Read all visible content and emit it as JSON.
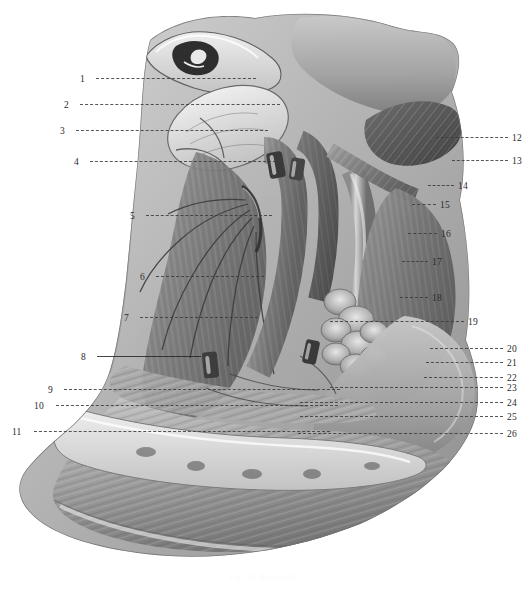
{
  "plate": {
    "kind": "anatomical-illustration",
    "subject": "grayscale neck dissection plate",
    "background_color": "#ffffff",
    "ink_color": "#2b2b2b",
    "leader_color": "#3a3a3a",
    "caption": "Fig. 72. Regio colli"
  },
  "labels_left": [
    {
      "n": "1",
      "x": 80,
      "y": 74,
      "lead_x": 96,
      "lead_w": 160,
      "style": "dashed"
    },
    {
      "n": "2",
      "x": 64,
      "y": 100,
      "lead_x": 80,
      "lead_w": 200,
      "style": "dashed"
    },
    {
      "n": "3",
      "x": 60,
      "y": 126,
      "lead_x": 76,
      "lead_w": 192,
      "style": "dashed"
    },
    {
      "n": "4",
      "x": 74,
      "y": 157,
      "lead_x": 90,
      "lead_w": 186,
      "style": "dashed"
    },
    {
      "n": "5",
      "x": 130,
      "y": 211,
      "lead_x": 146,
      "lead_w": 126,
      "style": "dashed"
    },
    {
      "n": "6",
      "x": 140,
      "y": 272,
      "lead_x": 156,
      "lead_w": 108,
      "style": "dashed"
    },
    {
      "n": "7",
      "x": 124,
      "y": 313,
      "lead_x": 140,
      "lead_w": 118,
      "style": "dashed"
    },
    {
      "n": "8",
      "x": 81,
      "y": 352,
      "lead_x": 97,
      "lead_w": 104,
      "style": "solid"
    },
    {
      "n": "9",
      "x": 48,
      "y": 385,
      "lead_x": 64,
      "lead_w": 276,
      "style": "dashed"
    },
    {
      "n": "10",
      "x": 34,
      "y": 401,
      "lead_x": 56,
      "lead_w": 282,
      "style": "dashed"
    },
    {
      "n": "11",
      "x": 12,
      "y": 427,
      "lead_x": 34,
      "lead_w": 296,
      "style": "dashed"
    }
  ],
  "labels_right": [
    {
      "n": "12",
      "x": 512,
      "y": 133,
      "lead_x": 436,
      "lead_w": 72,
      "style": "dashed"
    },
    {
      "n": "13",
      "x": 512,
      "y": 156,
      "lead_x": 452,
      "lead_w": 56,
      "style": "dashed"
    },
    {
      "n": "14",
      "x": 458,
      "y": 181,
      "lead_x": 428,
      "lead_w": 26,
      "style": "dashed"
    },
    {
      "n": "15",
      "x": 440,
      "y": 200,
      "lead_x": 412,
      "lead_w": 24,
      "style": "dashed"
    },
    {
      "n": "16",
      "x": 441,
      "y": 229,
      "lead_x": 408,
      "lead_w": 29,
      "style": "dashed"
    },
    {
      "n": "17",
      "x": 432,
      "y": 257,
      "lead_x": 402,
      "lead_w": 26,
      "style": "dashed"
    },
    {
      "n": "18",
      "x": 432,
      "y": 293,
      "lead_x": 400,
      "lead_w": 28,
      "style": "dashed"
    },
    {
      "n": "19",
      "x": 468,
      "y": 317,
      "lead_x": 330,
      "lead_w": 134,
      "style": "dashed"
    },
    {
      "n": "20",
      "x": 507,
      "y": 344,
      "lead_x": 430,
      "lead_w": 73,
      "style": "dashed"
    },
    {
      "n": "21",
      "x": 507,
      "y": 358,
      "lead_x": 426,
      "lead_w": 77,
      "style": "dashed"
    },
    {
      "n": "22",
      "x": 507,
      "y": 373,
      "lead_x": 424,
      "lead_w": 79,
      "style": "dashed"
    },
    {
      "n": "23",
      "x": 507,
      "y": 383,
      "lead_x": 330,
      "lead_w": 173,
      "style": "dashed"
    },
    {
      "n": "24",
      "x": 507,
      "y": 398,
      "lead_x": 300,
      "lead_w": 203,
      "style": "dashed"
    },
    {
      "n": "25",
      "x": 507,
      "y": 412,
      "lead_x": 300,
      "lead_w": 203,
      "style": "dashed"
    },
    {
      "n": "26",
      "x": 507,
      "y": 429,
      "lead_x": 298,
      "lead_w": 205,
      "style": "dashed"
    }
  ]
}
